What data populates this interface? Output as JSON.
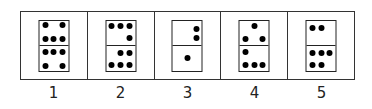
{
  "dominoes": [
    {
      "label": "1",
      "top": {
        "count": 5,
        "pips": [
          [
            20,
            20
          ],
          [
            80,
            20
          ],
          [
            20,
            75
          ],
          [
            50,
            75
          ],
          [
            80,
            75
          ]
        ]
      },
      "bottom": {
        "count": 5,
        "pips": [
          [
            20,
            25
          ],
          [
            50,
            25
          ],
          [
            80,
            25
          ],
          [
            20,
            80
          ],
          [
            80,
            80
          ]
        ]
      }
    },
    {
      "label": "2",
      "top": {
        "count": 4,
        "pips": [
          [
            20,
            22
          ],
          [
            50,
            22
          ],
          [
            80,
            22
          ],
          [
            80,
            72
          ]
        ]
      },
      "bottom": {
        "count": 5,
        "pips": [
          [
            50,
            28
          ],
          [
            80,
            28
          ],
          [
            20,
            78
          ],
          [
            50,
            78
          ],
          [
            80,
            78
          ]
        ]
      }
    },
    {
      "label": "3",
      "top": {
        "count": 2,
        "pips": [
          [
            80,
            35
          ],
          [
            80,
            72
          ]
        ]
      },
      "bottom": {
        "count": 1,
        "pips": [
          [
            50,
            50
          ]
        ]
      }
    },
    {
      "label": "4",
      "top": {
        "count": 3,
        "pips": [
          [
            50,
            22
          ],
          [
            20,
            75
          ],
          [
            80,
            75
          ]
        ]
      },
      "bottom": {
        "count": 4,
        "pips": [
          [
            20,
            25
          ],
          [
            20,
            78
          ],
          [
            50,
            78
          ],
          [
            80,
            78
          ]
        ]
      }
    },
    {
      "label": "5",
      "top": {
        "count": 2,
        "pips": [
          [
            20,
            30
          ],
          [
            50,
            30
          ]
        ]
      },
      "bottom": {
        "count": 5,
        "pips": [
          [
            20,
            28
          ],
          [
            50,
            28
          ],
          [
            80,
            28
          ],
          [
            20,
            78
          ],
          [
            50,
            78
          ]
        ]
      }
    }
  ]
}
